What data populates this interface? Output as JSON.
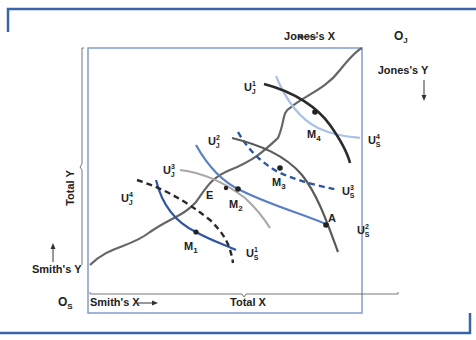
{
  "figure": {
    "origins": {
      "smith": "O",
      "smith_sub": "S",
      "jones": "O",
      "jones_sub": "J"
    },
    "axes": {
      "total_x": "Total X",
      "total_y": "Total Y",
      "smith_x": "Smith's X",
      "smith_y": "Smith's Y",
      "jones_x": "Jones's X",
      "jones_y": "Jones's Y"
    },
    "points": {
      "M1": "M",
      "M1_sub": "1",
      "M2": "M",
      "M2_sub": "2",
      "M3": "M",
      "M3_sub": "3",
      "M4": "M",
      "M4_sub": "4",
      "E": "E",
      "A": "A"
    },
    "curves": {
      "jones": [
        {
          "base": "U",
          "sub": "J",
          "sup": "1",
          "style": "solid",
          "color": "#2a2a2a"
        },
        {
          "base": "U",
          "sub": "J",
          "sup": "2",
          "style": "solid",
          "color": "#5a5a5a"
        },
        {
          "base": "U",
          "sub": "J",
          "sup": "3",
          "style": "solid",
          "color": "#a8a8a8"
        },
        {
          "base": "U",
          "sub": "J",
          "sup": "4",
          "style": "dashed",
          "color": "#2a2a2a"
        }
      ],
      "smith": [
        {
          "base": "U",
          "sub": "S",
          "sup": "1",
          "style": "solid",
          "color": "#2f55a0"
        },
        {
          "base": "U",
          "sub": "S",
          "sup": "2",
          "style": "solid",
          "color": "#5a7fc4"
        },
        {
          "base": "U",
          "sub": "S",
          "sup": "3",
          "style": "dashed",
          "color": "#2f55a0"
        },
        {
          "base": "U",
          "sub": "S",
          "sup": "4",
          "style": "solid",
          "color": "#a9c2e4"
        }
      ]
    },
    "contract_curve": {
      "label": "Contract curve",
      "color": "#666666"
    },
    "colors": {
      "frame_accent": "#3a64a8",
      "box_border": "#7b95c7"
    }
  }
}
